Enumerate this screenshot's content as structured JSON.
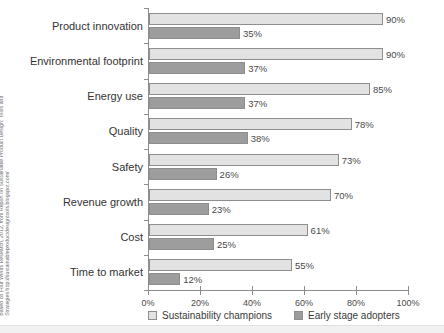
{
  "attribution": {
    "line1": "Based on Four Winds Research, 2012, from Report on Sustainable Product Design: Tools and",
    "line2": "Strategies http://sustainableproductdesigntools.blogspot.com/"
  },
  "legend": {
    "items": [
      {
        "label": "Sustainability champions",
        "color": "#e2e2e2",
        "swatch": "light"
      },
      {
        "label": "Early stage adopters",
        "color": "#9d9d9d",
        "swatch": "dark"
      }
    ]
  },
  "axis": {
    "x_ticks": [
      "0%",
      "20%",
      "40%",
      "60%",
      "80%",
      "100%"
    ]
  },
  "chart_data": {
    "type": "bar",
    "orientation": "horizontal",
    "title": "",
    "xlabel": "",
    "ylabel": "",
    "xlim": [
      0,
      100
    ],
    "grid": false,
    "legend_position": "bottom",
    "categories": [
      "Product innovation",
      "Environmental footprint",
      "Energy use",
      "Quality",
      "Safety",
      "Revenue growth",
      "Cost",
      "Time to market"
    ],
    "tick_labels": [
      "0%",
      "20%",
      "40%",
      "60%",
      "80%",
      "100%"
    ],
    "tick_values": [
      0,
      20,
      40,
      60,
      80,
      100
    ],
    "series": [
      {
        "name": "Sustainability champions",
        "color": "#e2e2e2",
        "values": [
          90,
          90,
          85,
          78,
          73,
          70,
          61,
          55
        ],
        "data_labels": [
          "90%",
          "90%",
          "85%",
          "78%",
          "73%",
          "70%",
          "61%",
          "55%"
        ]
      },
      {
        "name": "Early stage adopters",
        "color": "#9d9d9d",
        "values": [
          35,
          37,
          37,
          38,
          26,
          23,
          25,
          12
        ],
        "data_labels": [
          "35%",
          "37%",
          "37%",
          "38%",
          "26%",
          "23%",
          "25%",
          "12%"
        ]
      }
    ]
  }
}
